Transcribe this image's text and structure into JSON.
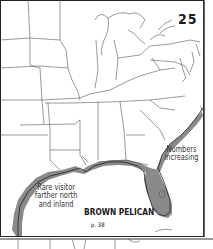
{
  "map": {
    "number": "25",
    "species": "BROWN PELICAN",
    "page_ref": "p. 38",
    "notes": {
      "atlantic": [
        "Numbers",
        "increasing"
      ],
      "inland": [
        "Rare visitor",
        "farther north",
        "and inland"
      ]
    },
    "colors": {
      "range_fill": "#8a8a8a",
      "state_lines": "#555555",
      "background": "#ffffff"
    }
  }
}
